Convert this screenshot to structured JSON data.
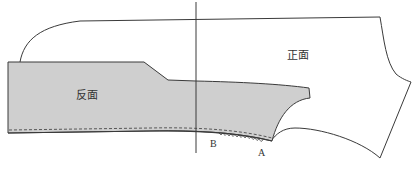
{
  "diagram": {
    "type": "garment-pattern",
    "colors": {
      "background": "#ffffff",
      "outline": "#3a3a3a",
      "reverse_fill": "#cfcfcf",
      "label": "#333333"
    },
    "labels": {
      "reverse_side": "反面",
      "front_side": "正面",
      "point_a": "A",
      "point_b": "B"
    },
    "pieces": [
      {
        "id": "front-piece",
        "label": "正面",
        "fill": "none"
      },
      {
        "id": "reverse-piece",
        "label": "反面",
        "fill": "#cfcfcf"
      }
    ],
    "annotations": [
      {
        "type": "stitch-line",
        "style": "dashed",
        "description": "seam allowance stitch line along lower edge"
      },
      {
        "type": "zigzag",
        "from": "B",
        "to": "A",
        "description": "easing / gathering mark between B and A"
      },
      {
        "type": "vertical-guide",
        "description": "vertical reference line"
      }
    ]
  }
}
